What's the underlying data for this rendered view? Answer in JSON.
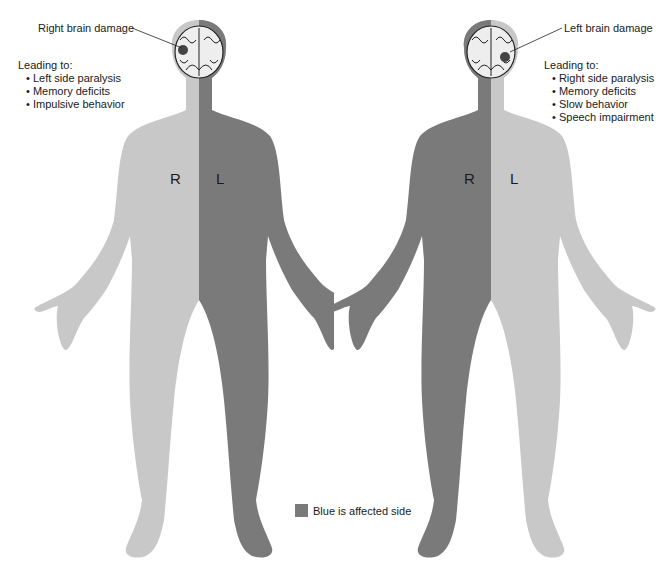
{
  "colors": {
    "affected": "#7a7a7a",
    "unaffected": "#c8c8c8",
    "lesion": "#444444",
    "text": "#1a1a1a"
  },
  "left_figure": {
    "title": "Right brain damage",
    "effects_heading": "Leading to:",
    "effects": [
      "Left side paralysis",
      "Memory deficits",
      "Impulsive behavior"
    ],
    "side_labels": {
      "viewer_left": "R",
      "viewer_right": "L"
    },
    "affected_side": "L"
  },
  "right_figure": {
    "title": "Left brain damage",
    "effects_heading": "Leading to:",
    "effects": [
      "Right side paralysis",
      "Memory deficits",
      "Slow behavior",
      "Speech impairment"
    ],
    "side_labels": {
      "viewer_left": "R",
      "viewer_right": "L"
    },
    "affected_side": "R"
  },
  "legend": {
    "label": "Blue is affected side",
    "icon": "legend-swatch"
  }
}
